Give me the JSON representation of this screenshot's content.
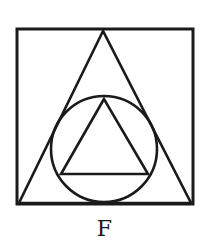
{
  "figure": {
    "label": "F",
    "stroke_color": "#1a1a1a",
    "background_color": "#ffffff",
    "shapes": [
      {
        "type": "square",
        "name": "outer-square",
        "x": 17,
        "y": 29,
        "width": 176,
        "height": 175
      },
      {
        "type": "triangle",
        "name": "large-triangle",
        "points": [
          [
            103,
            31
          ],
          [
            19,
            203
          ],
          [
            191,
            203
          ]
        ]
      },
      {
        "type": "circle",
        "name": "inscribed-circle",
        "cx": 104,
        "cy": 149,
        "r": 53
      },
      {
        "type": "triangle",
        "name": "inner-triangle",
        "points": [
          [
            104,
            99
          ],
          [
            61,
            174
          ],
          [
            148,
            174
          ]
        ]
      }
    ]
  }
}
